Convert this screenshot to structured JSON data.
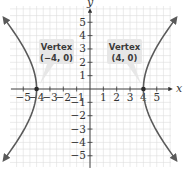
{
  "diagram": {
    "type": "hyperbola-graph",
    "axes": {
      "x_label": "x",
      "y_label": "y",
      "x_range": [
        -5,
        5
      ],
      "y_range": [
        -5,
        5
      ],
      "x_ticks": [
        "−5",
        "−4",
        "−3",
        "−2",
        "−1",
        "1",
        "2",
        "3",
        "4",
        "5"
      ],
      "y_ticks": [
        "5",
        "4",
        "3",
        "2",
        "1",
        "−1",
        "−2",
        "−3",
        "−4",
        "−5"
      ]
    },
    "curve": {
      "kind": "hyperbola",
      "orientation": "horizontal transverse axis",
      "vertices": [
        [
          -4,
          0
        ],
        [
          4,
          0
        ]
      ]
    },
    "callouts": [
      {
        "title": "Vertex",
        "coords": "(−4, 0)"
      },
      {
        "title": "Vertex",
        "coords": "(4, 0)"
      }
    ],
    "colors": {
      "grid": "#dcdcdc",
      "axis": "#333333",
      "curve": "#5a5a5a",
      "vertex_point": "#2a2a2a",
      "callout_bg": "#e6e6e6"
    }
  }
}
